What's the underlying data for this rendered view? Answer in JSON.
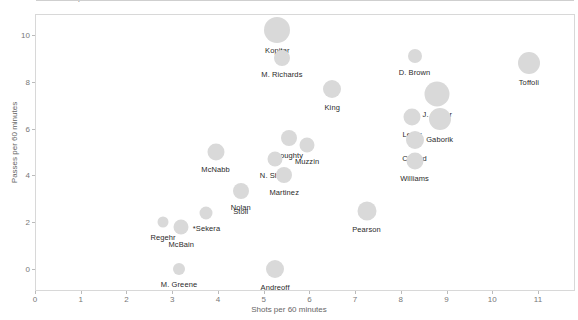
{
  "clipped_header": "Shots and Passes per 60 minutes",
  "axes": {
    "x_title": "Shots per 60 minutes",
    "y_title": "Passes per 60 minutes",
    "x_ticks": [
      "0",
      "1",
      "2",
      "3",
      "4",
      "5",
      "6",
      "7",
      "8",
      "9",
      "10",
      "11"
    ],
    "y_ticks": [
      "0",
      "2",
      "4",
      "6",
      "8",
      "10"
    ]
  },
  "colors": {
    "bubble": "#d9d9d9",
    "axis": "#d8d8d8",
    "tick_text": "#777777",
    "label_text": "#2a2a2a"
  },
  "chart_data": {
    "type": "scatter",
    "title": "Shots and Passes per 60 minutes",
    "xlabel": "Shots per 60 minutes",
    "ylabel": "Passes per 60 minutes",
    "xlim": [
      0,
      11.5
    ],
    "ylim": [
      -0.6,
      11.0
    ],
    "grid": false,
    "legend": null,
    "size_encoding": "bubble area encodes ice time / usage",
    "points": [
      {
        "label": "Kopitar",
        "x": 5.3,
        "y": 10.2,
        "size": 26,
        "label_dx": 0,
        "label_dy": 16
      },
      {
        "label": "M. Richards",
        "x": 5.4,
        "y": 9.0,
        "size": 16,
        "label_dx": 0,
        "label_dy": 12
      },
      {
        "label": "D. Brown",
        "x": 8.3,
        "y": 9.1,
        "size": 14,
        "label_dx": 0,
        "label_dy": 12
      },
      {
        "label": "Toffoli",
        "x": 10.8,
        "y": 8.8,
        "size": 22,
        "label_dx": 0,
        "label_dy": 15
      },
      {
        "label": "King",
        "x": 6.5,
        "y": 7.7,
        "size": 18,
        "label_dx": 0,
        "label_dy": 14
      },
      {
        "label": "J. Carter",
        "x": 8.8,
        "y": 7.5,
        "size": 25,
        "label_dx": 0,
        "label_dy": 16
      },
      {
        "label": "Lewis",
        "x": 8.25,
        "y": 6.5,
        "size": 17,
        "label_dx": 0,
        "label_dy": 13
      },
      {
        "label": "Gaborik",
        "x": 8.85,
        "y": 6.4,
        "size": 22,
        "label_dx": 0,
        "label_dy": 16
      },
      {
        "label": "Clifford",
        "x": 8.3,
        "y": 5.5,
        "size": 18,
        "label_dx": 0,
        "label_dy": 14
      },
      {
        "label": "Williams",
        "x": 8.3,
        "y": 4.6,
        "size": 17,
        "label_dx": 0,
        "label_dy": 13
      },
      {
        "label": "Doughty",
        "x": 5.55,
        "y": 5.6,
        "size": 16,
        "label_dx": 0,
        "label_dy": 13
      },
      {
        "label": "Muzzin",
        "x": 5.95,
        "y": 5.3,
        "size": 15,
        "label_dx": 0,
        "label_dy": 12
      },
      {
        "label": "McNabb",
        "x": 3.95,
        "y": 5.0,
        "size": 17,
        "label_dx": 0,
        "label_dy": 13
      },
      {
        "label": "N. Shore",
        "x": 5.25,
        "y": 4.7,
        "size": 15,
        "label_dx": 0,
        "label_dy": 12
      },
      {
        "label": "Martinez",
        "x": 5.45,
        "y": 4.0,
        "size": 16,
        "label_dx": 0,
        "label_dy": 13
      },
      {
        "label": "Nolan",
        "x": 4.5,
        "y": 3.35,
        "size": 16,
        "label_dx": 0,
        "label_dy": 12
      },
      {
        "label": "Stoll",
        "x": 4.5,
        "y": 3.35,
        "size": 0,
        "label_dx": 0,
        "label_dy": 16
      },
      {
        "label": "*Sekera",
        "x": 3.75,
        "y": 2.4,
        "size": 13,
        "label_dx": 0,
        "label_dy": 11
      },
      {
        "label": "Pearson",
        "x": 7.25,
        "y": 2.5,
        "size": 19,
        "label_dx": 0,
        "label_dy": 14
      },
      {
        "label": "Regehr",
        "x": 2.8,
        "y": 2.0,
        "size": 11,
        "label_dx": 0,
        "label_dy": 11
      },
      {
        "label": "McBain",
        "x": 3.2,
        "y": 1.8,
        "size": 15,
        "label_dx": 0,
        "label_dy": 13
      },
      {
        "label": "M. Greene",
        "x": 3.15,
        "y": 0.0,
        "size": 12,
        "label_dx": 0,
        "label_dy": 11
      },
      {
        "label": "Andreoff",
        "x": 5.25,
        "y": 0.0,
        "size": 18,
        "label_dx": 0,
        "label_dy": 14
      }
    ]
  }
}
